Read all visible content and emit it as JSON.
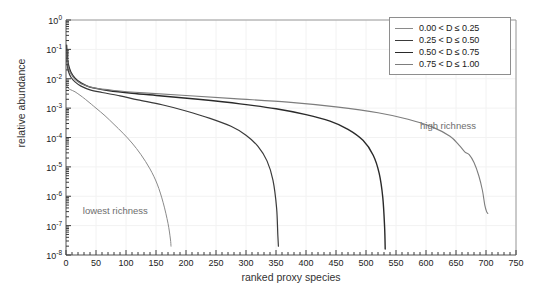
{
  "chart_data": {
    "type": "line",
    "title": "",
    "xlabel": "ranked proxy species",
    "ylabel": "relative abundance",
    "xlim": [
      0,
      750
    ],
    "ylim": [
      1e-08,
      1
    ],
    "yscale": "log",
    "xscale": "linear",
    "grid": true,
    "legend_position": "top-right",
    "xticks": [
      "0",
      "50",
      "100",
      "150",
      "200",
      "250",
      "300",
      "350",
      "400",
      "450",
      "500",
      "550",
      "600",
      "650",
      "700",
      "750"
    ],
    "yticks": [
      "10<sup>0</sup>",
      "10<sup>-1</sup>",
      "10<sup>-2</sup>",
      "10<sup>-3</sup>",
      "10<sup>-4</sup>",
      "10<sup>-5</sup>",
      "10<sup>-6</sup>",
      "10<sup>-7</sup>",
      "10<sup>-8</sup>"
    ],
    "ytick_exponents": [
      0,
      -1,
      -2,
      -3,
      -4,
      -5,
      -6,
      -7,
      -8
    ],
    "series": [
      {
        "name": "0.00 < D ≤ 0.25",
        "color": "#8a8a8a",
        "width": 1.0,
        "points": [
          [
            1,
            0.0065
          ],
          [
            2,
            0.0055
          ],
          [
            4,
            0.0047
          ],
          [
            8,
            0.0042
          ],
          [
            15,
            0.0036
          ],
          [
            25,
            0.0026
          ],
          [
            35,
            0.0018
          ],
          [
            50,
            0.001
          ],
          [
            65,
            0.00055
          ],
          [
            80,
            0.00028
          ],
          [
            95,
            0.00014
          ],
          [
            110,
            6.5e-05
          ],
          [
            125,
            2.6e-05
          ],
          [
            140,
            8.5e-06
          ],
          [
            152,
            2.6e-06
          ],
          [
            162,
            6e-07
          ],
          [
            170,
            1.2e-07
          ],
          [
            174,
            3.5e-08
          ],
          [
            175,
            2e-08
          ]
        ]
      },
      {
        "name": "0.25 < D ≤ 0.50",
        "color": "#3a3a3a",
        "width": 1.2,
        "points": [
          [
            1,
            0.055
          ],
          [
            2,
            0.03
          ],
          [
            4,
            0.018
          ],
          [
            8,
            0.0115
          ],
          [
            15,
            0.0078
          ],
          [
            25,
            0.0056
          ],
          [
            40,
            0.0042
          ],
          [
            60,
            0.0034
          ],
          [
            90,
            0.0026
          ],
          [
            120,
            0.0019
          ],
          [
            160,
            0.0013
          ],
          [
            200,
            0.0008
          ],
          [
            240,
            0.00045
          ],
          [
            275,
            0.00024
          ],
          [
            300,
            0.00012
          ],
          [
            320,
            5e-05
          ],
          [
            335,
            1.6e-05
          ],
          [
            345,
            3.5e-06
          ],
          [
            351,
            4e-07
          ],
          [
            353,
            5e-08
          ],
          [
            354,
            2e-08
          ]
        ]
      },
      {
        "name": "0.50 < D ≤ 0.75",
        "color": "#2a2a2a",
        "width": 1.4,
        "points": [
          [
            1,
            0.14
          ],
          [
            2,
            0.06
          ],
          [
            4,
            0.03
          ],
          [
            8,
            0.017
          ],
          [
            15,
            0.0105
          ],
          [
            25,
            0.0072
          ],
          [
            40,
            0.0052
          ],
          [
            70,
            0.004
          ],
          [
            110,
            0.0032
          ],
          [
            160,
            0.0026
          ],
          [
            220,
            0.002
          ],
          [
            290,
            0.0014
          ],
          [
            350,
            0.00095
          ],
          [
            400,
            0.0006
          ],
          [
            440,
            0.00036
          ],
          [
            470,
            0.00019
          ],
          [
            495,
            8e-05
          ],
          [
            512,
            2.5e-05
          ],
          [
            522,
            6e-06
          ],
          [
            528,
            9e-07
          ],
          [
            531,
            9e-08
          ],
          [
            532,
            1.6e-08
          ]
        ]
      },
      {
        "name": "0.75 < D ≤ 1.00",
        "color": "#7d7d7d",
        "width": 1.1,
        "points": [
          [
            1,
            0.09
          ],
          [
            2,
            0.045
          ],
          [
            4,
            0.024
          ],
          [
            8,
            0.015
          ],
          [
            15,
            0.0095
          ],
          [
            25,
            0.0068
          ],
          [
            45,
            0.005
          ],
          [
            80,
            0.004
          ],
          [
            130,
            0.0033
          ],
          [
            200,
            0.0027
          ],
          [
            280,
            0.0021
          ],
          [
            370,
            0.0016
          ],
          [
            450,
            0.0011
          ],
          [
            520,
            0.0007
          ],
          [
            570,
            0.00042
          ],
          [
            610,
            0.00023
          ],
          [
            640,
            0.00011
          ],
          [
            655,
            5.5e-05
          ],
          [
            665,
            3.2e-05
          ],
          [
            672,
            2.6e-05
          ],
          [
            680,
            1.4e-05
          ],
          [
            688,
            5e-06
          ],
          [
            694,
            1.6e-06
          ],
          [
            698,
            5e-07
          ],
          [
            701,
            3e-07
          ],
          [
            703,
            2.6e-07
          ]
        ]
      }
    ],
    "annotations": [
      {
        "text": "lowest richness",
        "x": 28,
        "y": 3e-07
      },
      {
        "text": "high richness",
        "x": 590,
        "y": 0.00022
      }
    ]
  }
}
